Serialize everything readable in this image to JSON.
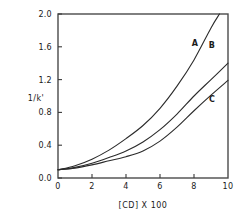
{
  "chart_data": {
    "type": "line",
    "title": "",
    "subtitle": "",
    "xlabel": "[CD] X 100",
    "ylabel": "1/k'",
    "xlim": [
      0,
      10
    ],
    "ylim": [
      0.0,
      2.0
    ],
    "xticks": [
      "0",
      "2",
      "4",
      "6",
      "8",
      "10"
    ],
    "xtick_values": [
      0,
      2,
      4,
      6,
      8,
      10
    ],
    "yticks": [
      "0.0",
      "0.4",
      "0.8",
      "1.2",
      "1.6",
      "2.0"
    ],
    "ytick_values": [
      0.0,
      0.4,
      0.8,
      1.2,
      1.6,
      2.0
    ],
    "grid": false,
    "legend": "inline-curve-labels",
    "series": [
      {
        "name": "A",
        "label": "A",
        "color": "#2b2b2b",
        "label_x": 8.05,
        "label_y": 1.61,
        "x": [
          0,
          1,
          2,
          3,
          4,
          5,
          6,
          7,
          8,
          9,
          9.5
        ],
        "values": [
          0.1,
          0.15,
          0.23,
          0.34,
          0.48,
          0.64,
          0.85,
          1.12,
          1.44,
          1.83,
          2.0
        ]
      },
      {
        "name": "B",
        "label": "B",
        "color": "#2b2b2b",
        "label_x": 9.05,
        "label_y": 1.59,
        "x": [
          0,
          1,
          2,
          3,
          4,
          5,
          6,
          7,
          8,
          9,
          10
        ],
        "values": [
          0.1,
          0.13,
          0.18,
          0.25,
          0.33,
          0.44,
          0.59,
          0.78,
          1.0,
          1.2,
          1.4
        ]
      },
      {
        "name": "C",
        "label": "C",
        "color": "#2b2b2b",
        "label_x": 9.05,
        "label_y": 0.93,
        "x": [
          0,
          1,
          2,
          3,
          4,
          5,
          6,
          7,
          8,
          9,
          10
        ],
        "values": [
          0.1,
          0.12,
          0.16,
          0.21,
          0.26,
          0.33,
          0.45,
          0.62,
          0.82,
          1.01,
          1.19
        ]
      }
    ]
  }
}
